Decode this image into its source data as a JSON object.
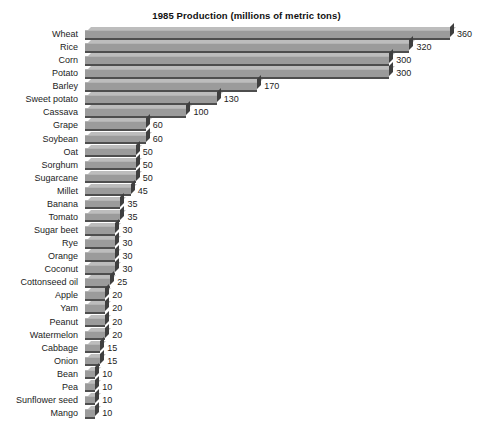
{
  "chart_data": {
    "type": "bar",
    "orientation": "horizontal",
    "title": "1985 Production (millions of metric tons)",
    "xlabel": "",
    "ylabel": "",
    "xlim": [
      0,
      360
    ],
    "grid": false,
    "legend": null,
    "value_labels": true,
    "units": "millions of metric tons",
    "year": 1985,
    "categories": [
      "Wheat",
      "Rice",
      "Corn",
      "Potato",
      "Barley",
      "Sweet potato",
      "Cassava",
      "Grape",
      "Soybean",
      "Oat",
      "Sorghum",
      "Sugarcane",
      "Millet",
      "Banana",
      "Tomato",
      "Sugar beet",
      "Rye",
      "Orange",
      "Coconut",
      "Cottonseed oil",
      "Apple",
      "Yam",
      "Peanut",
      "Watermelon",
      "Cabbage",
      "Onion",
      "Bean",
      "Pea",
      "Sunflower seed",
      "Mango"
    ],
    "values": [
      360,
      320,
      300,
      300,
      170,
      130,
      100,
      60,
      60,
      50,
      50,
      50,
      45,
      35,
      35,
      30,
      30,
      30,
      30,
      25,
      20,
      20,
      20,
      20,
      15,
      15,
      10,
      10,
      10,
      10
    ]
  },
  "style": {
    "bar_face_color": "#9b9b9b",
    "bar_top_color": "#bdbdbd",
    "bar_cap_color": "#3f3f3f",
    "background_color": "#ffffff",
    "text_color": "#1c1c1c"
  }
}
